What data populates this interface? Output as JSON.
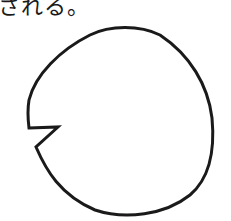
{
  "caption": {
    "text": "される。"
  },
  "figure": {
    "shape": "circle-with-notch",
    "stroke_color": "#1a1a1a",
    "fill_color": "#ffffff"
  }
}
